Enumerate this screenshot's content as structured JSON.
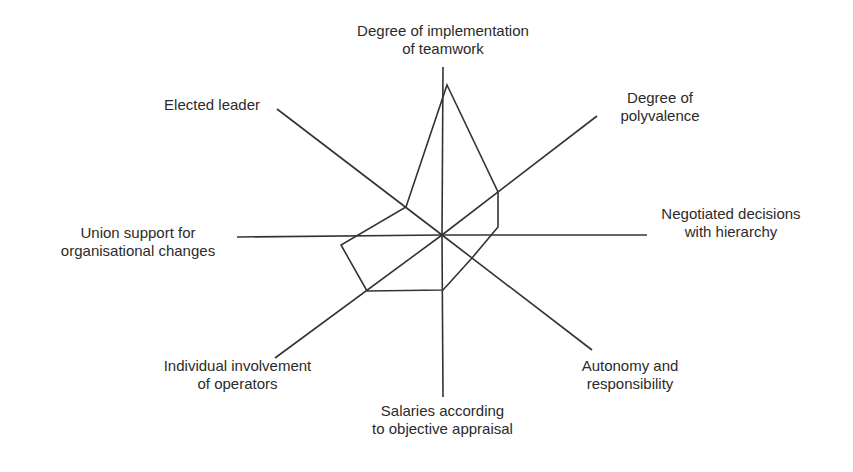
{
  "chart_data": {
    "type": "radar",
    "title": "",
    "center": [
      442,
      235
    ],
    "axes": [
      {
        "id": "teamwork",
        "label_lines": [
          "Degree of implementation",
          "of teamwork"
        ],
        "end": [
          443,
          67
        ],
        "value_point": [
          447,
          85
        ]
      },
      {
        "id": "polyvalence",
        "label_lines": [
          "Degree of",
          "polyvalence"
        ],
        "end": [
          597,
          116
        ],
        "value_point": [
          498,
          192
        ]
      },
      {
        "id": "negotiated",
        "label_lines": [
          "Negotiated decisions",
          "with hierarchy"
        ],
        "end": [
          647,
          235
        ],
        "value_point": [
          498,
          227
        ]
      },
      {
        "id": "autonomy",
        "label_lines": [
          "Autonomy and",
          "responsibility"
        ],
        "end": [
          592,
          350
        ],
        "value_point": [
          472,
          258
        ]
      },
      {
        "id": "salaries",
        "label_lines": [
          "Salaries according",
          "to objective appraisal"
        ],
        "end": [
          443,
          397
        ],
        "value_point": [
          443,
          290
        ]
      },
      {
        "id": "involvement",
        "label_lines": [
          "Individual involvement",
          "of operators"
        ],
        "end": [
          275,
          358
        ],
        "value_point": [
          367,
          291
        ]
      },
      {
        "id": "union",
        "label_lines": [
          "Union support for",
          "organisational changes"
        ],
        "end": [
          237,
          237
        ],
        "value_point": [
          341,
          245
        ]
      },
      {
        "id": "elected",
        "label_lines": [
          "Elected leader"
        ],
        "end": [
          277,
          109
        ],
        "value_point": [
          406,
          207
        ]
      }
    ],
    "series": [
      {
        "name": "profile",
        "relative_values": {
          "teamwork": 0.89,
          "polyvalence": 0.37,
          "negotiated": 0.27,
          "autonomy": 0.2,
          "salaries": 0.34,
          "involvement": 0.39,
          "union": 0.5,
          "elected": 0.22
        }
      }
    ],
    "polygon": [
      [
        447,
        85
      ],
      [
        498,
        192
      ],
      [
        498,
        227
      ],
      [
        472,
        258
      ],
      [
        443,
        290
      ],
      [
        367,
        291
      ],
      [
        341,
        245
      ],
      [
        406,
        207
      ]
    ],
    "grid": false,
    "legend": null
  },
  "labels": {
    "teamwork": [
      "Degree of implementation",
      "of teamwork"
    ],
    "polyvalence": [
      "Degree of",
      "polyvalence"
    ],
    "negotiated": [
      "Negotiated decisions",
      "with hierarchy"
    ],
    "autonomy": [
      "Autonomy and",
      "responsibility"
    ],
    "salaries": [
      "Salaries according",
      "to objective appraisal"
    ],
    "involvement": [
      "Individual involvement",
      "of operators"
    ],
    "union": [
      "Union support for",
      "organisational changes"
    ],
    "elected": [
      "Elected leader"
    ]
  },
  "colors": {
    "line": "#333333",
    "background": "#ffffff"
  }
}
